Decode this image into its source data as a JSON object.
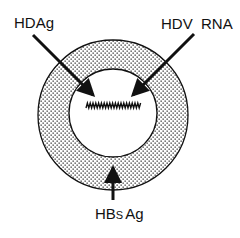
{
  "diagram": {
    "labels": {
      "hdag": "HDAg",
      "hdv_rna": "HDV  RNA",
      "hbsag_prefix": "HB",
      "hbsag_sub": "S",
      "hbsag_suffix": "Ag"
    },
    "components": [
      {
        "name": "HDAg",
        "points_to": "inner core (nucleocapsid)",
        "arrow_from": "top-left"
      },
      {
        "name": "HDV RNA",
        "points_to": "circular RNA genome (zig-zag)",
        "arrow_from": "top-right"
      },
      {
        "name": "HBsAg",
        "points_to": "outer envelope (dotted ring)",
        "arrow_from": "bottom"
      }
    ],
    "colors": {
      "stroke": "#111111",
      "dots": "#333333",
      "background": "#ffffff"
    }
  }
}
